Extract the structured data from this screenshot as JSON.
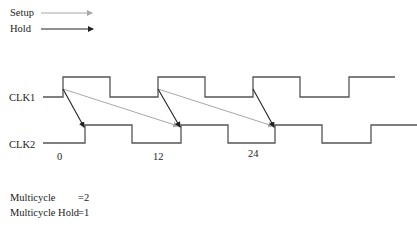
{
  "legend": {
    "items": [
      {
        "label": "Setup",
        "color": "#a8a8a8"
      },
      {
        "label": "Hold",
        "color": "#222222"
      }
    ]
  },
  "signals": [
    {
      "label": "CLK1",
      "color": "#555555"
    },
    {
      "label": "CLK2",
      "color": "#555555"
    }
  ],
  "time_labels": [
    "0",
    "12",
    "24"
  ],
  "constraints": [
    {
      "label": "Multicycle",
      "value": "=2"
    },
    {
      "label": "Multicycle Hold",
      "value": "=1"
    }
  ]
}
